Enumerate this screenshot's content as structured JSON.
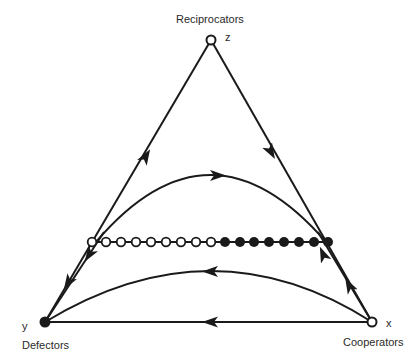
{
  "diagram": {
    "type": "simplex-phase-portrait",
    "colors": {
      "line": "#1a1a1a",
      "open_fill": "#ffffff",
      "filled": "#1a1a1a",
      "background": "#ffffff"
    },
    "vertices": {
      "top": {
        "label": "Reciprocators",
        "variable": "z",
        "x": 211,
        "y": 40,
        "marker": "open"
      },
      "left": {
        "label": "Defectors",
        "variable": "y",
        "x": 45,
        "y": 322,
        "marker": "filled"
      },
      "right": {
        "label": "Cooperators",
        "variable": "x",
        "x": 372,
        "y": 322,
        "marker": "open"
      }
    },
    "fixed_point_line": {
      "y": 242,
      "open_points_x": [
        92,
        106,
        121,
        136,
        151,
        166,
        181,
        196,
        211
      ],
      "filled_points_x": [
        225,
        240,
        254,
        269,
        284,
        299,
        314,
        328
      ]
    },
    "trajectories": [
      {
        "name": "left-edge",
        "direction": "Defectors to Reciprocators"
      },
      {
        "name": "right-edge",
        "direction": "Reciprocators to Cooperators"
      },
      {
        "name": "bottom-edge",
        "direction": "Cooperators to Defectors"
      },
      {
        "name": "upper-arc",
        "direction": "left to right, between open and filled points"
      },
      {
        "name": "lower-arc",
        "direction": "Cooperators to Defectors"
      }
    ]
  }
}
